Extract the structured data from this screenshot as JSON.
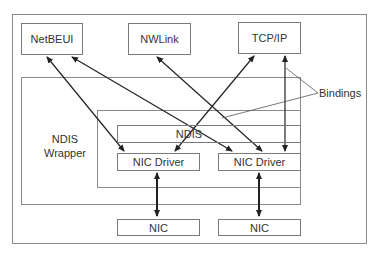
{
  "diagram": {
    "protocols": [
      {
        "id": "netbeui",
        "label": "NetBEUI"
      },
      {
        "id": "nwlink",
        "label": "NWLink"
      },
      {
        "id": "tcpip",
        "label": "TCP/IP"
      }
    ],
    "ndis_wrapper": {
      "label_line1": "NDIS",
      "label_line2": "Wrapper"
    },
    "ndis": {
      "label": "NDIS"
    },
    "nic_drivers": [
      {
        "id": "driver1",
        "label": "NIC Driver"
      },
      {
        "id": "driver2",
        "label": "NIC Driver"
      }
    ],
    "nics": [
      {
        "id": "nic1",
        "label": "NIC"
      },
      {
        "id": "nic2",
        "label": "NIC"
      }
    ],
    "callout": {
      "label": "Bindings"
    },
    "edges": [
      {
        "from": "NetBEUI",
        "to": "NIC Driver (1)",
        "type": "bidirectional"
      },
      {
        "from": "NetBEUI",
        "to": "NIC Driver (2)",
        "type": "bidirectional"
      },
      {
        "from": "NWLink",
        "to": "NIC Driver (2)",
        "type": "bidirectional"
      },
      {
        "from": "TCP/IP",
        "to": "NIC Driver (1)",
        "type": "bidirectional"
      },
      {
        "from": "TCP/IP",
        "to": "NIC Driver (2)",
        "type": "bidirectional"
      },
      {
        "from": "NIC Driver (1)",
        "to": "NIC (1)",
        "type": "bidirectional"
      },
      {
        "from": "NIC Driver (2)",
        "to": "NIC (2)",
        "type": "bidirectional"
      }
    ]
  }
}
